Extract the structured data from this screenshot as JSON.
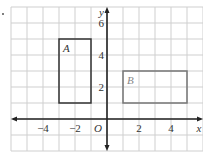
{
  "diagram": {
    "grid": {
      "x_min": -6,
      "x_max": 6,
      "y_min": -2,
      "y_max": 7,
      "cell_px": 16,
      "color": "#cfcfcf"
    },
    "axes": {
      "x_label": "x",
      "y_label": "y",
      "origin_label": "O",
      "x_ticks": [
        {
          "value": -4,
          "label": "−4"
        },
        {
          "value": -2,
          "label": "−2"
        },
        {
          "value": 2,
          "label": "2"
        },
        {
          "value": 4,
          "label": "4"
        }
      ],
      "y_ticks": [
        {
          "value": 2,
          "label": "2"
        },
        {
          "value": 4,
          "label": "4"
        },
        {
          "value": 6,
          "label": "6"
        }
      ],
      "color": "#222222"
    },
    "shapes": [
      {
        "label": "A",
        "x1": -3,
        "y1": 1,
        "x2": -1,
        "y2": 5,
        "stroke": "#333333",
        "label_color": "#333333"
      },
      {
        "label": "B",
        "x1": 1,
        "y1": 1,
        "x2": 5,
        "y2": 3,
        "stroke": "#777777",
        "label_color": "#888888"
      }
    ]
  }
}
